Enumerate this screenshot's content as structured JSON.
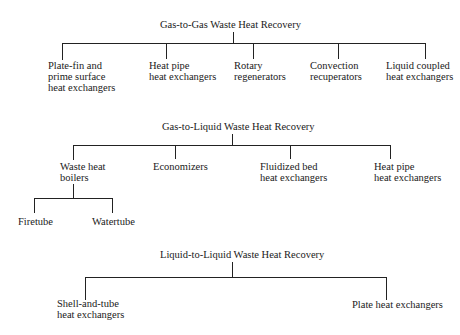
{
  "diagrams": [
    {
      "title": "Gas-to-Gas Waste Heat Recovery",
      "children": [
        {
          "label": "Plate-fin and\nprime surface\nheat exchangers"
        },
        {
          "label": "Heat pipe\nheat exchangers"
        },
        {
          "label": "Rotary\nregenerators"
        },
        {
          "label": "Convection\nrecuperators"
        },
        {
          "label": "Liquid coupled\nheat exchangers"
        }
      ]
    },
    {
      "title": "Gas-to-Liquid Waste Heat Recovery",
      "children": [
        {
          "label": "Waste heat\nboilers",
          "children": [
            {
              "label": "Firetube"
            },
            {
              "label": "Watertube"
            }
          ]
        },
        {
          "label": "Economizers"
        },
        {
          "label": "Fluidized bed\nheat exchangers"
        },
        {
          "label": "Heat pipe\nheat exchangers"
        }
      ]
    },
    {
      "title": "Liquid-to-Liquid Waste Heat Recovery",
      "children": [
        {
          "label": "Shell-and-tube\nheat exchangers"
        },
        {
          "label": "Plate heat exchangers"
        }
      ]
    }
  ]
}
